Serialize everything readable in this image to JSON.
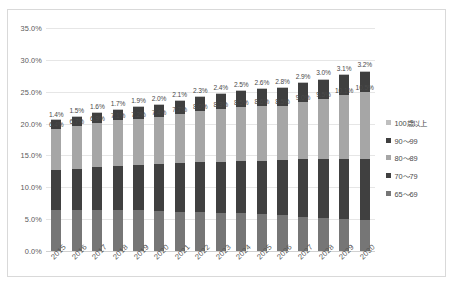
{
  "chart_data": {
    "type": "bar",
    "subtype": "stacked-column",
    "title": "",
    "xlabel": "",
    "ylabel": "",
    "ylim": [
      0,
      35
    ],
    "ytick_labels": [
      "0.0%",
      "5.0%",
      "10.0%",
      "15.0%",
      "20.0%",
      "25.0%",
      "30.0%",
      "35.0%"
    ],
    "ytick_values": [
      0,
      5,
      10,
      15,
      20,
      25,
      30,
      35
    ],
    "grid": true,
    "legend_position": "right",
    "categories": [
      "2015",
      "2016",
      "2017",
      "2018",
      "2019",
      "2020",
      "2021",
      "2022",
      "2023",
      "2024",
      "2025",
      "2026",
      "2027",
      "2028",
      "2029",
      "2030"
    ],
    "series": [
      {
        "name": "65～69",
        "color": "#767676",
        "values": [
          6.4,
          6.4,
          6.5,
          6.5,
          6.4,
          6.3,
          6.2,
          6.1,
          6.0,
          5.9,
          5.8,
          5.6,
          5.4,
          5.2,
          5.0,
          4.8
        ],
        "labels_shown": false
      },
      {
        "name": "70～79",
        "color": "#404040",
        "values": [
          6.3,
          6.5,
          6.7,
          6.9,
          7.1,
          7.3,
          7.6,
          7.8,
          8.0,
          8.2,
          8.4,
          8.7,
          9.0,
          9.2,
          9.4,
          9.6
        ],
        "labels_shown": false
      },
      {
        "name": "80～89",
        "color": "#a6a6a6",
        "values": [
          6.4,
          6.7,
          6.9,
          7.1,
          7.2,
          7.4,
          7.7,
          8.0,
          8.3,
          8.5,
          8.6,
          8.5,
          9.0,
          9.5,
          10.1,
          10.5
        ],
        "labels": [
          "6.4%",
          "6.7%",
          "6.9%",
          "7.1%",
          "7.2%",
          "7.4%",
          "7.7%",
          "8.0%",
          "8.3%",
          "8.5%",
          "8.6%",
          "8.5%",
          "9.0%",
          "9.5%",
          "10.1%",
          "10.5%"
        ],
        "labels_shown": true
      },
      {
        "name": "90～99",
        "color": "#3f3f3f",
        "values": [
          1.4,
          1.5,
          1.6,
          1.7,
          1.9,
          2.0,
          2.1,
          2.3,
          2.4,
          2.5,
          2.6,
          2.8,
          2.9,
          3.0,
          3.1,
          3.2
        ],
        "labels": [
          "1.4%",
          "1.5%",
          "1.6%",
          "1.7%",
          "1.9%",
          "2.0%",
          "2.1%",
          "2.3%",
          "2.4%",
          "2.5%",
          "2.6%",
          "2.8%",
          "2.9%",
          "3.0%",
          "3.1%",
          "3.2%"
        ],
        "labels_shown": true
      },
      {
        "name": "100歳以上",
        "color": "#bfbfbf",
        "values": [
          0.05,
          0.05,
          0.06,
          0.06,
          0.07,
          0.07,
          0.08,
          0.09,
          0.1,
          0.11,
          0.12,
          0.13,
          0.14,
          0.15,
          0.16,
          0.18
        ],
        "labels_shown": false
      }
    ],
    "totals": [
      20.55,
      21.15,
      21.76,
      22.26,
      22.67,
      23.07,
      23.68,
      24.29,
      24.8,
      25.21,
      25.52,
      25.73,
      26.44,
      27.05,
      27.76,
      28.28
    ]
  },
  "legend": {
    "items": [
      {
        "label": "100歳以上",
        "color": "#bfbfbf"
      },
      {
        "label": "90～99",
        "color": "#3f3f3f"
      },
      {
        "label": "80～89",
        "color": "#a6a6a6"
      },
      {
        "label": "70～79",
        "color": "#404040"
      },
      {
        "label": "65～69",
        "color": "#767676"
      }
    ]
  }
}
